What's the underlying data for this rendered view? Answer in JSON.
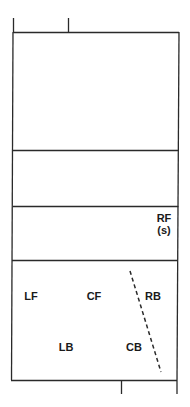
{
  "diagram": {
    "line_color": "#2a2a2a",
    "players": [
      {
        "id": "RF",
        "label": "RF",
        "sub": "(s)",
        "x": 163,
        "y": 218
      },
      {
        "id": "LF",
        "label": "LF",
        "x": 31,
        "y": 296
      },
      {
        "id": "CF",
        "label": "CF",
        "x": 94,
        "y": 296
      },
      {
        "id": "RB",
        "label": "RB",
        "x": 153,
        "y": 296
      },
      {
        "id": "LB",
        "label": "LB",
        "x": 66,
        "y": 347
      },
      {
        "id": "CB",
        "label": "CB",
        "x": 134,
        "y": 347
      }
    ],
    "dashed_line": {
      "x1": 130,
      "y1": 271,
      "x2": 161,
      "y2": 372
    }
  }
}
